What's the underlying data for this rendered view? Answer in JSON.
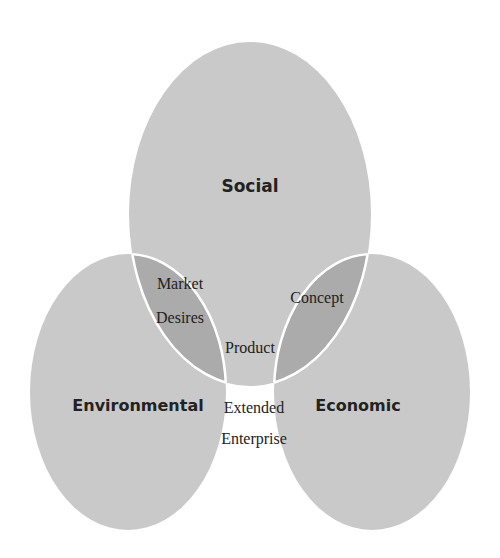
{
  "diagram": {
    "type": "venn",
    "colors": {
      "background": "#ffffff",
      "single": "#c9c9c9",
      "pair": "#a9a9a9",
      "triple": "#9a9a9a",
      "outline": "#ffffff"
    },
    "sets": {
      "social": {
        "label": "Social"
      },
      "environmental": {
        "label": "Environmental"
      },
      "economic": {
        "label": "Economic"
      }
    },
    "intersections": {
      "social_environmental": {
        "line1": "Market",
        "line2": "Desires"
      },
      "social_economic": {
        "label": "Concept"
      },
      "environmental_economic": {
        "line1": "Extended",
        "line2": "Enterprise"
      },
      "all": {
        "label": "Product"
      }
    }
  }
}
